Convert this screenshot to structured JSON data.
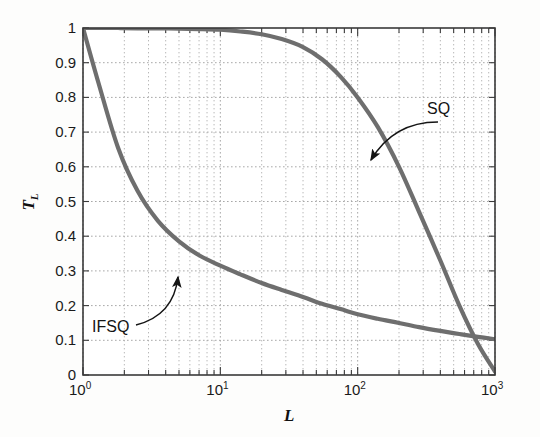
{
  "chart_data": {
    "type": "line",
    "title": "",
    "xlabel": "L",
    "ylabel": "T_L",
    "xscale": "log",
    "yscale": "linear",
    "xlim": [
      1,
      1000
    ],
    "ylim": [
      0,
      1
    ],
    "grid": true,
    "grid_style": "dotted",
    "legend_position": "inline-annotations",
    "xtick_labels": [
      "10",
      "10",
      "10",
      "10"
    ],
    "xtick_exponents": [
      "0",
      "1",
      "2",
      "3"
    ],
    "xtick_values": [
      1,
      10,
      100,
      1000
    ],
    "ytick_labels": [
      "0",
      "0.1",
      "0.2",
      "0.3",
      "0.4",
      "0.5",
      "0.6",
      "0.7",
      "0.8",
      "0.9",
      "1"
    ],
    "ytick_values": [
      0,
      0.1,
      0.2,
      0.3,
      0.4,
      0.5,
      0.6,
      0.7,
      0.8,
      0.9,
      1.0
    ],
    "series": [
      {
        "name": "SQ",
        "color": "#6e6e6e",
        "x": [
          1,
          1.3,
          1.8,
          2.5,
          3.5,
          5,
          7,
          10,
          14,
          20,
          28,
          40,
          55,
          75,
          100,
          140,
          200,
          280,
          400,
          550,
          750,
          1000
        ],
        "values": [
          1.0,
          1.0,
          1.0,
          0.999,
          0.999,
          0.998,
          0.997,
          0.995,
          0.99,
          0.982,
          0.968,
          0.945,
          0.91,
          0.86,
          0.8,
          0.715,
          0.6,
          0.47,
          0.33,
          0.2,
          0.09,
          0.01
        ]
      },
      {
        "name": "IFSQ",
        "color": "#6e6e6e",
        "x": [
          1,
          1.3,
          1.8,
          2.5,
          3.5,
          5,
          7,
          10,
          14,
          20,
          28,
          40,
          55,
          75,
          100,
          140,
          200,
          280,
          400,
          550,
          750,
          1000
        ],
        "values": [
          1.0,
          0.84,
          0.655,
          0.53,
          0.445,
          0.385,
          0.345,
          0.315,
          0.29,
          0.265,
          0.245,
          0.225,
          0.205,
          0.19,
          0.175,
          0.162,
          0.15,
          0.138,
          0.127,
          0.118,
          0.11,
          0.103
        ]
      }
    ],
    "annotations": [
      {
        "label": "SQ",
        "text_x": 427,
        "text_y": 100,
        "arrow_from_x": 438,
        "arrow_from_y": 122,
        "arrow_to_x": 371,
        "arrow_to_y": 160
      },
      {
        "label": "IFSQ",
        "text_x": 92,
        "text_y": 318,
        "arrow_from_x": 136,
        "arrow_from_y": 325,
        "arrow_to_x": 178,
        "arrow_to_y": 277
      }
    ]
  },
  "axis_labels": {
    "y_base": "T",
    "y_sub": "L",
    "x": "L"
  },
  "colors": {
    "curve": "#6e6e6e",
    "grid": "#b4b4b4",
    "axis": "#3a3a3a",
    "text": "#141414",
    "background": "#fdfdfc"
  }
}
